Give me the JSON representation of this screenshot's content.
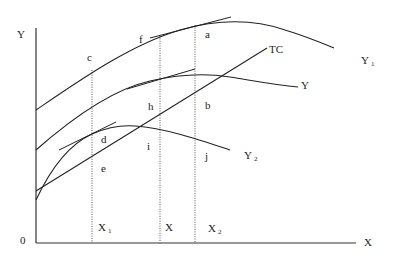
{
  "diagram": {
    "axes": {
      "y_label": "Y",
      "x_label": "X",
      "origin_label": "0"
    },
    "curves": {
      "Y1": {
        "label": "Y",
        "subscript": "1"
      },
      "Y": {
        "label": "Y"
      },
      "Y2": {
        "label": "Y",
        "subscript": "2"
      },
      "TC": {
        "label": "TC"
      }
    },
    "vertical_markers": [
      {
        "label": "X",
        "subscript": "1"
      },
      {
        "label": "X"
      },
      {
        "label": "X",
        "subscript": "2"
      }
    ],
    "points": {
      "a": "a",
      "b": "b",
      "c": "c",
      "d": "d",
      "e": "e",
      "f": "f",
      "h": "h",
      "i": "i",
      "j": "j"
    }
  }
}
